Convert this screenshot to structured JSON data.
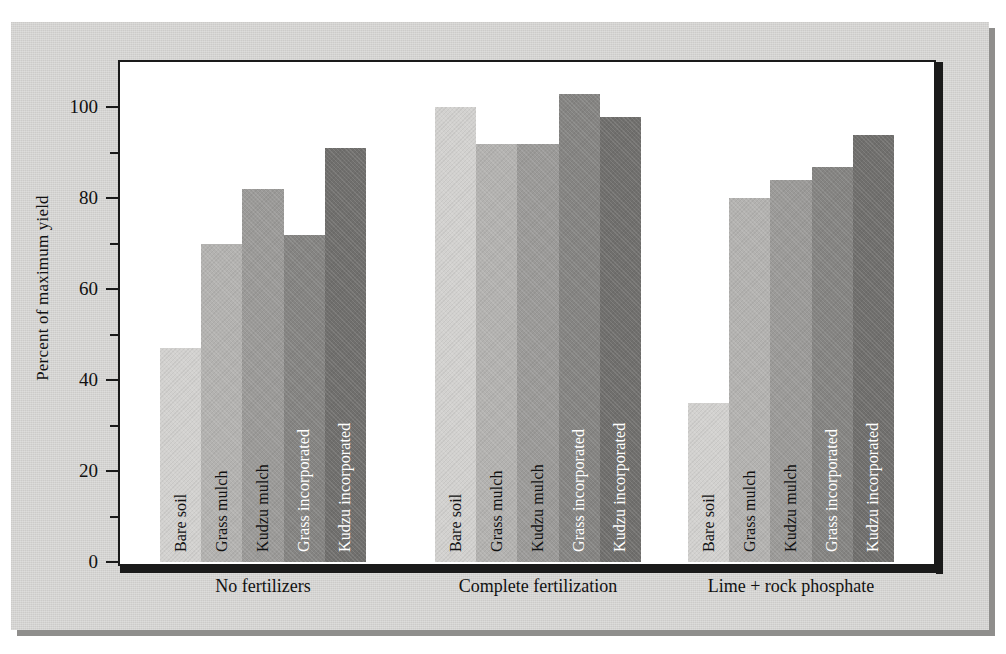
{
  "chart_data": {
    "type": "bar",
    "title": "",
    "xlabel": "",
    "ylabel": "Percent of maximum yield",
    "ylim": [
      0,
      110
    ],
    "ytick_labels": [
      "0",
      "20",
      "40",
      "60",
      "80",
      "100"
    ],
    "ytick_values": [
      0,
      20,
      40,
      60,
      80,
      100
    ],
    "yminor_values": [
      10,
      30,
      50,
      70,
      90
    ],
    "grid": false,
    "legend": "none",
    "categories": [
      "No fertilizers",
      "Complete fertilization",
      "Lime + rock phosphate"
    ],
    "series": [
      {
        "name": "Bare soil",
        "values": [
          47,
          100,
          35
        ],
        "color": "#d2d1cf",
        "label_color": "dark"
      },
      {
        "name": "Grass mulch",
        "values": [
          70,
          92,
          80
        ],
        "color": "#b3b2b0",
        "label_color": "dark"
      },
      {
        "name": "Kudzu mulch",
        "values": [
          82,
          92,
          84
        ],
        "color": "#9b9a98",
        "label_color": "dark"
      },
      {
        "name": "Grass incorporated",
        "values": [
          72,
          103,
          87
        ],
        "color": "#858482",
        "label_color": "light"
      },
      {
        "name": "Kudzu incorporated",
        "values": [
          91,
          98,
          94
        ],
        "color": "#706f6d",
        "label_color": "light"
      }
    ]
  },
  "figure": {
    "panel_color": "#d4d3d1",
    "plot_background": "#ffffff",
    "axis_color": "#1a1a1a"
  }
}
